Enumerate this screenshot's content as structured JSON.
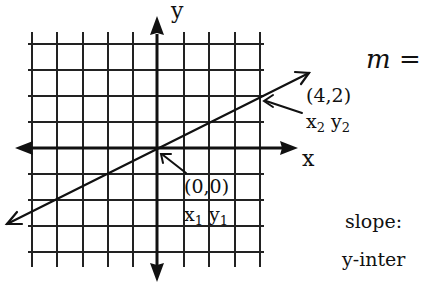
{
  "diagram": {
    "type": "coordinate-plane-line",
    "axes": {
      "x_label": "x",
      "y_label": "y"
    },
    "grid": {
      "columns": 10,
      "rows": 9,
      "grid_on": true
    },
    "points": [
      {
        "coords": "(4,2)",
        "label_x": "x",
        "sub_x": "2",
        "label_y": "y",
        "sub_y": "2"
      },
      {
        "coords": "(0,0)",
        "label_x": "x",
        "sub_x": "1",
        "label_y": "y",
        "sub_y": "1"
      }
    ],
    "line": {
      "slope": 0.5,
      "through": [
        "(0,0)",
        "(4,2)"
      ]
    }
  },
  "side_text": {
    "formula": "m =",
    "slope_label": "slope:",
    "intercept_label": "y-inter"
  },
  "colors": {
    "ink": "#111111",
    "background": "#ffffff"
  }
}
